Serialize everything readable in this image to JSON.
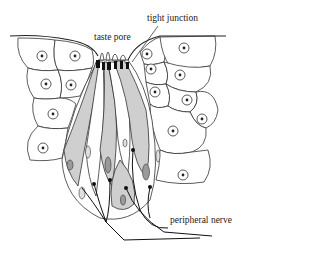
{
  "figure": {
    "labels": {
      "taste_pore": "taste pore",
      "tight_junction": "tight junction",
      "peripheral_nerve": "peripheral nerve"
    }
  },
  "colors": {
    "line": "#333333",
    "taste_cell_fill": "#cfcfcf",
    "nucleus_dark": "#9a9a9a",
    "junction": "#111111",
    "background": "#ffffff"
  }
}
